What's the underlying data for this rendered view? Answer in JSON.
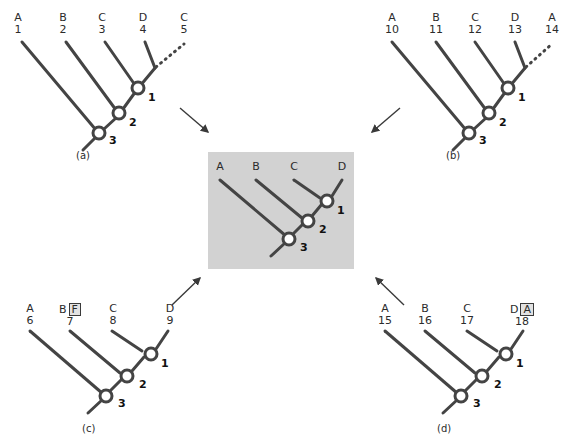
{
  "figure": {
    "background_color": "#ffffff",
    "line_color": "#444444",
    "center_panel_fill": "#d2d2d2",
    "node_fill": "#ffffff"
  },
  "center": {
    "name": "consensus-tree",
    "tips": [
      {
        "taxon": "A"
      },
      {
        "taxon": "B"
      },
      {
        "taxon": "C"
      },
      {
        "taxon": "D"
      }
    ],
    "nodes": [
      {
        "label": "1"
      },
      {
        "label": "2"
      },
      {
        "label": "3"
      }
    ]
  },
  "panels": [
    {
      "id": "a",
      "caption": "(a)",
      "tips": [
        {
          "taxon": "A",
          "num": "1",
          "boxed": ""
        },
        {
          "taxon": "B",
          "num": "2",
          "boxed": ""
        },
        {
          "taxon": "C",
          "num": "3",
          "boxed": ""
        },
        {
          "taxon": "D",
          "num": "4",
          "boxed": ""
        },
        {
          "taxon": "C",
          "num": "5",
          "boxed": ""
        }
      ],
      "nodes": [
        {
          "label": "1"
        },
        {
          "label": "2"
        },
        {
          "label": "3"
        }
      ],
      "has_dashed_branch": true
    },
    {
      "id": "b",
      "caption": "(b)",
      "tips": [
        {
          "taxon": "A",
          "num": "10",
          "boxed": ""
        },
        {
          "taxon": "B",
          "num": "11",
          "boxed": ""
        },
        {
          "taxon": "C",
          "num": "12",
          "boxed": ""
        },
        {
          "taxon": "D",
          "num": "13",
          "boxed": ""
        },
        {
          "taxon": "A",
          "num": "14",
          "boxed": ""
        }
      ],
      "nodes": [
        {
          "label": "1"
        },
        {
          "label": "2"
        },
        {
          "label": "3"
        }
      ],
      "has_dashed_branch": true
    },
    {
      "id": "c",
      "caption": "(c)",
      "tips": [
        {
          "taxon": "A",
          "num": "6",
          "boxed": ""
        },
        {
          "taxon": "B",
          "num": "7",
          "boxed": "F"
        },
        {
          "taxon": "C",
          "num": "8",
          "boxed": ""
        },
        {
          "taxon": "D",
          "num": "9",
          "boxed": ""
        }
      ],
      "nodes": [
        {
          "label": "1"
        },
        {
          "label": "2"
        },
        {
          "label": "3"
        }
      ],
      "has_dashed_branch": false
    },
    {
      "id": "d",
      "caption": "(d)",
      "tips": [
        {
          "taxon": "A",
          "num": "15",
          "boxed": ""
        },
        {
          "taxon": "B",
          "num": "16",
          "boxed": ""
        },
        {
          "taxon": "C",
          "num": "17",
          "boxed": ""
        },
        {
          "taxon": "D",
          "num": "18",
          "boxed": "A"
        }
      ],
      "nodes": [
        {
          "label": "1"
        },
        {
          "label": "2"
        },
        {
          "label": "3"
        }
      ],
      "has_dashed_branch": false
    }
  ],
  "arrows": [
    {
      "name": "arrow-a-to-center",
      "direction": "down-right"
    },
    {
      "name": "arrow-b-to-center",
      "direction": "down-left"
    },
    {
      "name": "arrow-c-to-center",
      "direction": "up-right"
    },
    {
      "name": "arrow-d-to-center",
      "direction": "up-left"
    }
  ]
}
